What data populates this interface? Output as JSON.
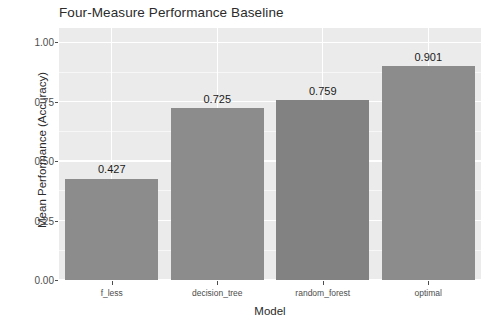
{
  "chart_data": {
    "type": "bar",
    "title": "Four-Measure Performance Baseline",
    "xlabel": "Model",
    "ylabel": "Mean Performance (Accuracy)",
    "categories": [
      "f_less",
      "decision_tree",
      "random_forest",
      "optimal"
    ],
    "values": [
      0.427,
      0.725,
      0.759,
      0.901
    ],
    "value_labels": [
      "0.427",
      "0.725",
      "0.759",
      "0.901"
    ],
    "ylim": [
      0.0,
      1.06
    ],
    "ytick_values": [
      0.0,
      0.25,
      0.5,
      0.75,
      1.0
    ],
    "ytick_labels": [
      "0.00",
      "0.25",
      "0.50",
      "0.75",
      "1.00"
    ],
    "yminor_values": [
      0.125,
      0.375,
      0.625,
      0.875
    ],
    "grid": true,
    "legend": "none",
    "bar_colors": [
      "#8c8c8c",
      "#8c8c8c",
      "#828282",
      "#8c8c8c"
    ],
    "panel_background": "#ebebeb",
    "gridline_color": "#ffffff",
    "figure_background": "#ffffff",
    "text_color": "#2b2b2b",
    "axis_text_color": "#4d4d4d"
  }
}
